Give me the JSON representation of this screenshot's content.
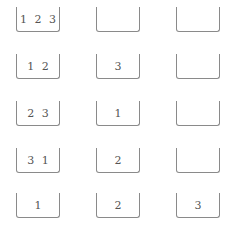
{
  "states": [
    {
      "pegs": [
        "1 2 3",
        "",
        ""
      ]
    },
    {
      "pegs": [
        "1 2",
        "3",
        ""
      ]
    },
    {
      "pegs": [
        "2 3",
        "1",
        ""
      ]
    },
    {
      "pegs": [
        "3 1",
        "2",
        ""
      ]
    },
    {
      "pegs": [
        "1",
        "2",
        "3"
      ]
    }
  ],
  "colors": {
    "outline": "#8a8a8a",
    "text": "#555555"
  }
}
